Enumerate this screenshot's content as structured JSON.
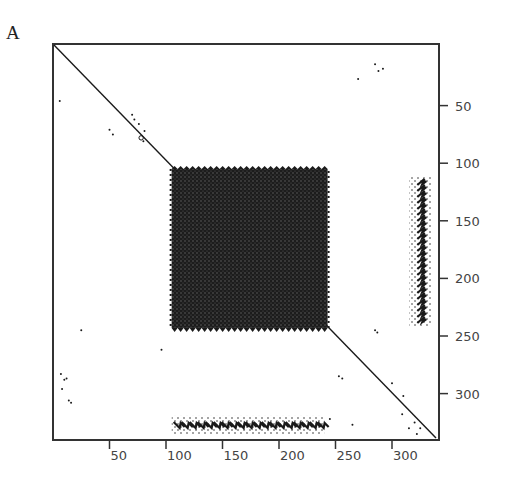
{
  "figure": {
    "panel_label": "A"
  },
  "chart_data": {
    "type": "scatter",
    "subtype": "dot-plot (self-similarity matrix)",
    "title": "",
    "xlabel": "",
    "ylabel": "",
    "xlim": [
      0,
      340
    ],
    "ylim": [
      340,
      0
    ],
    "x_ticks": [
      50,
      100,
      150,
      200,
      250,
      300
    ],
    "y_ticks": [
      50,
      100,
      150,
      200,
      250,
      300
    ],
    "y_axis_position": "right",
    "grid": false,
    "legend": null,
    "main_diagonal": {
      "from": [
        0,
        0
      ],
      "to": [
        335,
        340
      ]
    },
    "dense_block": {
      "x": [
        105,
        243
      ],
      "y": [
        105,
        243
      ],
      "description": "dense square block of repeated matches"
    },
    "side_band_right": {
      "x": [
        318,
        332
      ],
      "y": [
        112,
        242
      ],
      "description": "vertical band of off-diagonal repeats"
    },
    "side_band_bottom": {
      "x": [
        105,
        240
      ],
      "y": [
        322,
        333
      ],
      "description": "horizontal band of off-diagonal repeats"
    },
    "scattered_points": [
      [
        6,
        46
      ],
      [
        50,
        71
      ],
      [
        53,
        75
      ],
      [
        70,
        58
      ],
      [
        72,
        62
      ],
      [
        76,
        66
      ],
      [
        81,
        72
      ],
      [
        80,
        81
      ],
      [
        270,
        27
      ],
      [
        285,
        14
      ],
      [
        288,
        20
      ],
      [
        292,
        18
      ],
      [
        25,
        245
      ],
      [
        96,
        262
      ],
      [
        7,
        283
      ],
      [
        10,
        288
      ],
      [
        12,
        287
      ],
      [
        8,
        296
      ],
      [
        14,
        306
      ],
      [
        16,
        308
      ],
      [
        285,
        245
      ],
      [
        287,
        247
      ],
      [
        253,
        285
      ],
      [
        256,
        287
      ],
      [
        300,
        291
      ],
      [
        310,
        302
      ],
      [
        309,
        318
      ],
      [
        315,
        330
      ],
      [
        320,
        325
      ],
      [
        325,
        330
      ],
      [
        322,
        335
      ],
      [
        245,
        322
      ],
      [
        265,
        327
      ]
    ]
  },
  "axes": {
    "x_tick_labels": [
      "50",
      "100",
      "150",
      "200",
      "250",
      "300"
    ],
    "y_tick_labels": [
      "50",
      "100",
      "150",
      "200",
      "250",
      "300"
    ]
  },
  "colors": {
    "ink": "#1a1a1a",
    "frame": "#333333",
    "tick_text": "#444444",
    "background": "#ffffff"
  }
}
